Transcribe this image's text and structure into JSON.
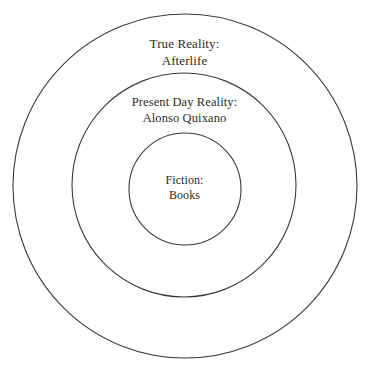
{
  "diagram": {
    "type": "concentric-circles",
    "background_color": "#ffffff",
    "stroke_color": "#3a3a3a",
    "text_color": "#2b2b2b",
    "rings": [
      {
        "id": "outer",
        "name": "true-reality",
        "title": "True Reality:",
        "subtitle": "Afterlife",
        "center_x": 185,
        "center_y": 186,
        "radius": 172
      },
      {
        "id": "middle",
        "name": "present-day-reality",
        "title": "Present Day Reality:",
        "subtitle": "Alonso Quixano",
        "center_x": 184,
        "center_y": 185,
        "radius": 112
      },
      {
        "id": "inner",
        "name": "fiction",
        "title": "Fiction:",
        "subtitle": "Books",
        "center_x": 185,
        "center_y": 189,
        "radius": 56
      }
    ]
  }
}
